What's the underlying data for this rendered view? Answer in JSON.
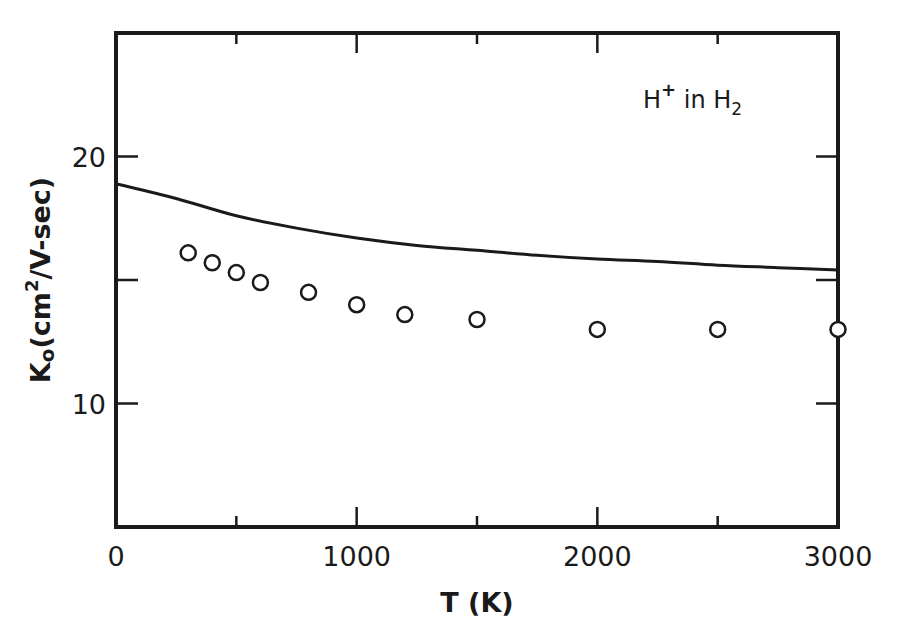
{
  "chart_data": {
    "type": "line",
    "title": "",
    "annotation": "H+ in H2",
    "annotation_parts": {
      "base": "H",
      "sup": "+",
      "mid": " in H",
      "sub": "2"
    },
    "xlabel": "T (K)",
    "ylabel": "K0 (cm2/V-sec)",
    "ylabel_parts": {
      "k": "K",
      "ksub": "o",
      "open": "(cm",
      "sup": "2",
      "rest": "/V-sec)"
    },
    "xlim": [
      0,
      3000
    ],
    "ylim": [
      5,
      25
    ],
    "x_ticks": [
      0,
      500,
      1000,
      1500,
      2000,
      2500,
      3000
    ],
    "x_tick_labels": [
      "0",
      "1000",
      "2000",
      "3000"
    ],
    "x_tick_label_values": [
      0,
      1000,
      2000,
      3000
    ],
    "y_ticks": [
      10,
      15,
      20
    ],
    "y_tick_labels": [
      "10",
      "20"
    ],
    "y_tick_label_values": [
      10,
      20
    ],
    "grid": false,
    "legend": null,
    "series": [
      {
        "name": "theory (solid curve)",
        "style": "line",
        "x": [
          0,
          250,
          500,
          750,
          1000,
          1250,
          1500,
          1750,
          2000,
          2250,
          2500,
          2750,
          3000
        ],
        "values": [
          18.9,
          18.3,
          17.6,
          17.1,
          16.7,
          16.4,
          16.2,
          16.0,
          15.85,
          15.75,
          15.6,
          15.5,
          15.4
        ]
      },
      {
        "name": "experimental (open circles)",
        "style": "open-circle",
        "x": [
          300,
          400,
          500,
          600,
          800,
          1000,
          1200,
          1500,
          2000,
          2500,
          3000
        ],
        "values": [
          16.1,
          15.7,
          15.3,
          14.9,
          14.5,
          14.0,
          13.6,
          13.4,
          13.0,
          13.0,
          13.0
        ]
      }
    ],
    "colors": {
      "ink": "#1a1a1a",
      "background": "#ffffff"
    }
  }
}
